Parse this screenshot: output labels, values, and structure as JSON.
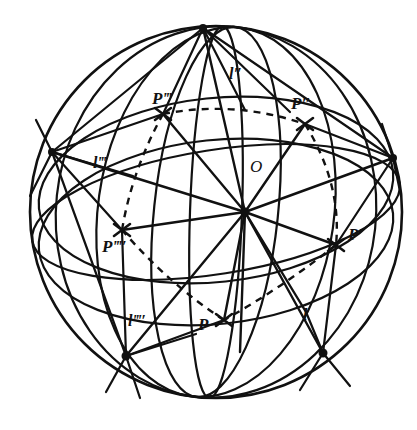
{
  "figure": {
    "stroke_color": "#111111",
    "background_color": "#ffffff",
    "sphere": {
      "center_x": 216,
      "center_y": 212,
      "radius": 186
    },
    "center_point": {
      "name": "O",
      "x": 245,
      "y": 212
    },
    "point_labels": [
      {
        "id": "P",
        "text": "P",
        "x": 198,
        "y": 316,
        "marker_x": 224,
        "marker_y": 320
      },
      {
        "id": "Pp",
        "text": "P′",
        "x": 348,
        "y": 226,
        "marker_x": 336,
        "marker_y": 245
      },
      {
        "id": "Ppp",
        "text": "P″",
        "x": 291,
        "y": 95,
        "marker_x": 305,
        "marker_y": 124
      },
      {
        "id": "Pppp",
        "text": "P‴",
        "x": 152,
        "y": 90,
        "marker_x": 163,
        "marker_y": 114
      },
      {
        "id": "Ppppp",
        "text": "P‴′",
        "x": 102,
        "y": 238,
        "marker_x": 122,
        "marker_y": 230
      }
    ],
    "line_labels": [
      {
        "id": "l",
        "text": "l",
        "x": 303,
        "y": 307
      },
      {
        "id": "lpp",
        "text": "l″",
        "x": 229,
        "y": 66
      },
      {
        "id": "lppp",
        "text": "l‴",
        "x": 93,
        "y": 155
      },
      {
        "id": "lpppp",
        "text": "l‴′",
        "x": 128,
        "y": 313
      }
    ],
    "center_label": {
      "id": "O",
      "text": "O",
      "x": 250,
      "y": 158
    },
    "dashed_polygon_vertices": [
      [
        224,
        320
      ],
      [
        336,
        245
      ],
      [
        305,
        124
      ],
      [
        163,
        114
      ],
      [
        122,
        230
      ]
    ],
    "great_circle_count": 7,
    "dash_pattern": "7 6"
  }
}
